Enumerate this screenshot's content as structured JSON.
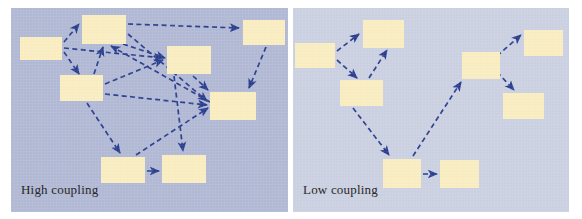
{
  "figure": {
    "background_color": "#ffffff",
    "node_color": "#fbeec2",
    "arrow_color": "#2b3f8f"
  },
  "panels": [
    {
      "id": "high-coupling",
      "caption": "High coupling",
      "background_color": "#b3bad6",
      "node_count": 8,
      "arrow_count": 16,
      "nodes": [
        {
          "id": "h1",
          "x": 9,
          "y": 29,
          "w": 42,
          "h": 23
        },
        {
          "id": "h2",
          "x": 71,
          "y": 7,
          "w": 44,
          "h": 29
        },
        {
          "id": "h3",
          "x": 49,
          "y": 67,
          "w": 43,
          "h": 26
        },
        {
          "id": "h4",
          "x": 156,
          "y": 38,
          "w": 44,
          "h": 28
        },
        {
          "id": "h5",
          "x": 232,
          "y": 12,
          "w": 42,
          "h": 25
        },
        {
          "id": "h6",
          "x": 199,
          "y": 84,
          "w": 46,
          "h": 28
        },
        {
          "id": "h7",
          "x": 90,
          "y": 149,
          "w": 44,
          "h": 26
        },
        {
          "id": "h8",
          "x": 151,
          "y": 147,
          "w": 44,
          "h": 28
        }
      ],
      "edges": [
        {
          "from": "h1",
          "to": "h2"
        },
        {
          "from": "h1",
          "to": "h3"
        },
        {
          "from": "h1",
          "to": "h4"
        },
        {
          "from": "h2",
          "to": "h5"
        },
        {
          "from": "h2",
          "to": "h6"
        },
        {
          "from": "h2",
          "to": "h4"
        },
        {
          "from": "h3",
          "to": "h2"
        },
        {
          "from": "h3",
          "to": "h4"
        },
        {
          "from": "h3",
          "to": "h6"
        },
        {
          "from": "h3",
          "to": "h7"
        },
        {
          "from": "h4",
          "to": "h6"
        },
        {
          "from": "h4",
          "to": "h8"
        },
        {
          "from": "h5",
          "to": "h6"
        },
        {
          "from": "h6",
          "to": "h2"
        },
        {
          "from": "h7",
          "to": "h8"
        },
        {
          "from": "h7",
          "to": "h6"
        }
      ]
    },
    {
      "id": "low-coupling",
      "caption": "Low coupling",
      "background_color": "#ccd2e3",
      "node_count": 8,
      "arrow_count": 7,
      "nodes": [
        {
          "id": "l1",
          "x": 2,
          "y": 35,
          "w": 40,
          "h": 25
        },
        {
          "id": "l2",
          "x": 70,
          "y": 12,
          "w": 41,
          "h": 28
        },
        {
          "id": "l3",
          "x": 47,
          "y": 72,
          "w": 43,
          "h": 26
        },
        {
          "id": "l4",
          "x": 169,
          "y": 44,
          "w": 38,
          "h": 27
        },
        {
          "id": "l5",
          "x": 231,
          "y": 22,
          "w": 39,
          "h": 26
        },
        {
          "id": "l6",
          "x": 210,
          "y": 85,
          "w": 41,
          "h": 26
        },
        {
          "id": "l7",
          "x": 90,
          "y": 151,
          "w": 38,
          "h": 29
        },
        {
          "id": "l8",
          "x": 147,
          "y": 152,
          "w": 39,
          "h": 28
        }
      ],
      "edges": [
        {
          "from": "l1",
          "to": "l2"
        },
        {
          "from": "l1",
          "to": "l3"
        },
        {
          "from": "l3",
          "to": "l2"
        },
        {
          "from": "l3",
          "to": "l7"
        },
        {
          "from": "l7",
          "to": "l4"
        },
        {
          "from": "l4",
          "to": "l5"
        },
        {
          "from": "l4",
          "to": "l6"
        },
        {
          "from": "l7",
          "to": "l8"
        }
      ]
    }
  ]
}
